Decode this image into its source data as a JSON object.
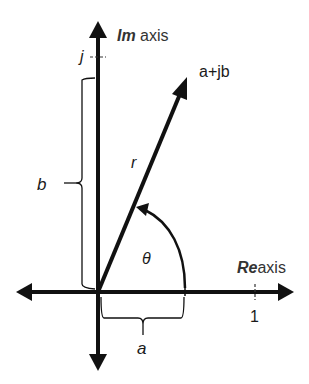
{
  "diagram": {
    "im_axis": {
      "prefix": "Im",
      "suffix": " axis"
    },
    "re_axis": {
      "prefix": "Re",
      "suffix": "axis"
    },
    "labels": {
      "point": "a+jb",
      "magnitude": "r",
      "angle": "θ",
      "imag_part": "b",
      "real_part": "a",
      "imag_unit_tick": "j",
      "real_unit_tick": "1"
    },
    "colors": {
      "stroke": "#111111",
      "text": "#1a1a1a",
      "axis_title": "#333333",
      "background": "#ffffff"
    }
  }
}
